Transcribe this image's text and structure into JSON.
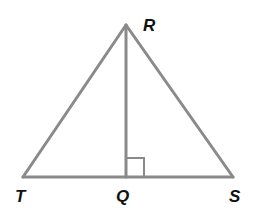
{
  "diagram": {
    "type": "triangle",
    "colors": {
      "line": "#8a8a8a",
      "label": "#111111"
    },
    "points": {
      "R": {
        "label": "R",
        "x": 126,
        "y": 25
      },
      "T": {
        "label": "T",
        "x": 23,
        "y": 177
      },
      "S": {
        "label": "S",
        "x": 233,
        "y": 177
      },
      "Q": {
        "label": "Q",
        "x": 126,
        "y": 177
      }
    },
    "segments": [
      "RT",
      "RS",
      "TS",
      "RQ"
    ],
    "right_angle_at": "Q"
  }
}
